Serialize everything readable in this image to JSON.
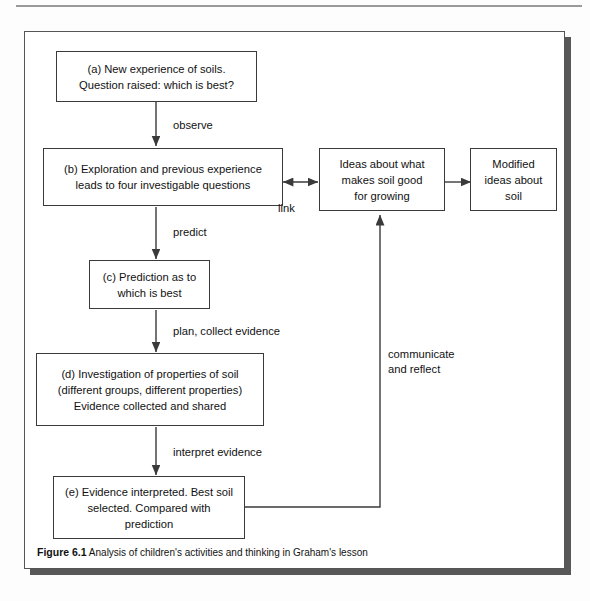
{
  "figure": {
    "caption_label": "Figure 6.1",
    "caption_text": "Analysis of children's activities and thinking in Graham's lesson"
  },
  "diagram": {
    "type": "flowchart",
    "nodes": [
      {
        "id": "a",
        "label": "(a) New experience of soils.\nQuestion raised: which is best?"
      },
      {
        "id": "b",
        "label": "(b) Exploration and previous experience\nleads to four investigable questions"
      },
      {
        "id": "c",
        "label": "(c) Prediction as to\nwhich is best"
      },
      {
        "id": "d",
        "label": "(d) Investigation of properties of soil\n(different groups, different properties)\nEvidence collected and shared"
      },
      {
        "id": "e",
        "label": "(e) Evidence interpreted. Best soil\nselected. Compared with\nprediction"
      },
      {
        "id": "ideas",
        "label": "Ideas about what\nmakes soil good\nfor growing"
      },
      {
        "id": "modified",
        "label": "Modified\nideas about\nsoil"
      }
    ],
    "edges": [
      {
        "from": "a",
        "to": "b",
        "label": "observe"
      },
      {
        "from": "b",
        "to": "c",
        "label": "predict"
      },
      {
        "from": "c",
        "to": "d",
        "label": "plan, collect evidence"
      },
      {
        "from": "d",
        "to": "e",
        "label": "interpret evidence"
      },
      {
        "from": "b",
        "to": "ideas",
        "label": "link"
      },
      {
        "from": "ideas",
        "to": "modified",
        "label": ""
      },
      {
        "from": "e",
        "to": "ideas",
        "label": "communicate\nand reflect"
      }
    ],
    "edge_labels": {
      "observe": "observe",
      "predict": "predict",
      "plan_collect": "plan, collect evidence",
      "interpret": "interpret evidence",
      "link": "link",
      "communicate": "communicate\nand reflect"
    }
  },
  "colors": {
    "box_border": "#3a3a3a",
    "line": "#3a3a3a",
    "frame_border": "#555555",
    "shadow": "#585858",
    "text": "#111111",
    "page_background": "#fdfdfd"
  }
}
